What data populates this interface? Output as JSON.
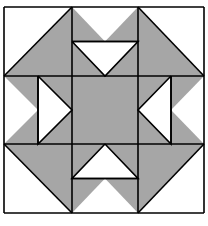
{
  "figure": {
    "type": "quilt-block",
    "colors": {
      "background": "#ffffff",
      "fill_light": "#ffffff",
      "fill_dark": "#a6a6a6",
      "line": "#000000"
    },
    "stroke_width": 1.6,
    "grid": {
      "x": [
        4,
        72,
        138,
        204
      ],
      "y": [
        7,
        76,
        144,
        213
      ]
    },
    "cells": [
      {
        "row": 0,
        "col": 0,
        "kind": "half-square",
        "diagonal": "bl-tr",
        "dark": "lower-right"
      },
      {
        "row": 0,
        "col": 1,
        "kind": "flying-geese-pair",
        "orientation": "down",
        "split": "horizontal"
      },
      {
        "row": 0,
        "col": 2,
        "kind": "half-square",
        "diagonal": "tl-br",
        "dark": "lower-left"
      },
      {
        "row": 1,
        "col": 0,
        "kind": "flying-geese-pair",
        "orientation": "right",
        "split": "vertical"
      },
      {
        "row": 1,
        "col": 1,
        "kind": "solid",
        "dark": "all"
      },
      {
        "row": 1,
        "col": 2,
        "kind": "flying-geese-pair",
        "orientation": "left",
        "split": "vertical"
      },
      {
        "row": 2,
        "col": 0,
        "kind": "half-square",
        "diagonal": "tl-br",
        "dark": "upper-right"
      },
      {
        "row": 2,
        "col": 1,
        "kind": "flying-geese-pair",
        "orientation": "up",
        "split": "horizontal"
      },
      {
        "row": 2,
        "col": 2,
        "kind": "half-square",
        "diagonal": "bl-tr",
        "dark": "upper-left"
      }
    ],
    "caption": ""
  }
}
